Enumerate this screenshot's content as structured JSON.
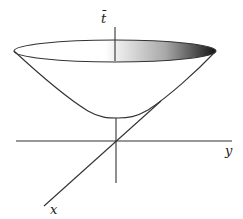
{
  "figure": {
    "type": "hyperboloid-surface-diagram",
    "axes": {
      "t_label": "t̄",
      "y_label": "y",
      "x_label": "x"
    },
    "colors": {
      "line": "#333333",
      "gradient_start": "#ffffff",
      "gradient_end": "#1a1a1a",
      "background": "#ffffff"
    }
  }
}
